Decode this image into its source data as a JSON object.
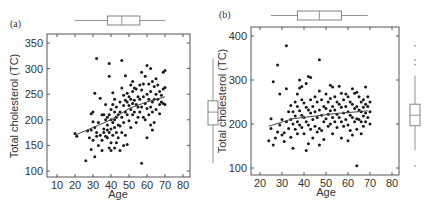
{
  "chart_data": [
    {
      "panel": "(a)",
      "type": "scatter",
      "title": "",
      "xlabel": "Age",
      "ylabel": "Total cholesterol (TC)",
      "xlim": [
        5,
        85
      ],
      "ylim": [
        90,
        360
      ],
      "xticks": [
        10,
        20,
        30,
        40,
        50,
        60,
        70,
        80
      ],
      "yticks": [
        100,
        150,
        200,
        250,
        300,
        350
      ],
      "grid": false,
      "trend_line": {
        "type": "lowess",
        "points": [
          [
            20,
            170
          ],
          [
            30,
            185
          ],
          [
            40,
            200
          ],
          [
            50,
            222
          ],
          [
            60,
            235
          ],
          [
            70,
            245
          ]
        ]
      },
      "marginal_boxplot_x": {
        "min": 20,
        "q1": 38,
        "median": 46,
        "q3": 56,
        "max": 70
      },
      "marginal_boxplot_y": {
        "min": 115,
        "q1": 190,
        "median": 215,
        "q3": 237,
        "max": 320
      },
      "points": [
        [
          20,
          173
        ],
        [
          21,
          168
        ],
        [
          26,
          120
        ],
        [
          27,
          178
        ],
        [
          28,
          165
        ],
        [
          29,
          142
        ],
        [
          29,
          180
        ],
        [
          29,
          212
        ],
        [
          30,
          215
        ],
        [
          30,
          196
        ],
        [
          30,
          160
        ],
        [
          31,
          128
        ],
        [
          31,
          252
        ],
        [
          31,
          185
        ],
        [
          32,
          320
        ],
        [
          32,
          175
        ],
        [
          32,
          168
        ],
        [
          33,
          150
        ],
        [
          33,
          195
        ],
        [
          34,
          242
        ],
        [
          34,
          170
        ],
        [
          35,
          210
        ],
        [
          35,
          160
        ],
        [
          35,
          140
        ],
        [
          36,
          182
        ],
        [
          36,
          175
        ],
        [
          36,
          210
        ],
        [
          37,
          168
        ],
        [
          37,
          200
        ],
        [
          37,
          230
        ],
        [
          38,
          180
        ],
        [
          38,
          205
        ],
        [
          38,
          190
        ],
        [
          38,
          165
        ],
        [
          39,
          285
        ],
        [
          39,
          310
        ],
        [
          39,
          210
        ],
        [
          39,
          175
        ],
        [
          39,
          145
        ],
        [
          40,
          220
        ],
        [
          40,
          200
        ],
        [
          40,
          182
        ],
        [
          40,
          155
        ],
        [
          40,
          140
        ],
        [
          41,
          253
        ],
        [
          41,
          230
        ],
        [
          41,
          195
        ],
        [
          41,
          170
        ],
        [
          42,
          240
        ],
        [
          42,
          215
        ],
        [
          42,
          200
        ],
        [
          42,
          185
        ],
        [
          42,
          145
        ],
        [
          43,
          225
        ],
        [
          43,
          205
        ],
        [
          43,
          175
        ],
        [
          43,
          155
        ],
        [
          44,
          210
        ],
        [
          44,
          190
        ],
        [
          44,
          165
        ],
        [
          45,
          235
        ],
        [
          45,
          215
        ],
        [
          45,
          188
        ],
        [
          45,
          140
        ],
        [
          46,
          316
        ],
        [
          46,
          262
        ],
        [
          46,
          205
        ],
        [
          46,
          175
        ],
        [
          47,
          248
        ],
        [
          47,
          228
        ],
        [
          47,
          195
        ],
        [
          47,
          150
        ],
        [
          48,
          286
        ],
        [
          48,
          238
        ],
        [
          48,
          215
        ],
        [
          48,
          170
        ],
        [
          49,
          252
        ],
        [
          49,
          235
        ],
        [
          49,
          210
        ],
        [
          49,
          152
        ],
        [
          50,
          245
        ],
        [
          50,
          228
        ],
        [
          50,
          198
        ],
        [
          51,
          268
        ],
        [
          51,
          240
        ],
        [
          51,
          220
        ],
        [
          51,
          185
        ],
        [
          52,
          275
        ],
        [
          52,
          255
        ],
        [
          52,
          232
        ],
        [
          52,
          210
        ],
        [
          53,
          262
        ],
        [
          53,
          238
        ],
        [
          53,
          215
        ],
        [
          54,
          260
        ],
        [
          54,
          230
        ],
        [
          54,
          195
        ],
        [
          55,
          245
        ],
        [
          55,
          225
        ],
        [
          55,
          205
        ],
        [
          56,
          268
        ],
        [
          56,
          240
        ],
        [
          56,
          215
        ],
        [
          57,
          293
        ],
        [
          57,
          258
        ],
        [
          57,
          225
        ],
        [
          57,
          115
        ],
        [
          58,
          270
        ],
        [
          58,
          245
        ],
        [
          58,
          205
        ],
        [
          59,
          285
        ],
        [
          59,
          232
        ],
        [
          59,
          200
        ],
        [
          60,
          306
        ],
        [
          60,
          250
        ],
        [
          60,
          222
        ],
        [
          60,
          165
        ],
        [
          61,
          270
        ],
        [
          61,
          240
        ],
        [
          61,
          210
        ],
        [
          62,
          300
        ],
        [
          62,
          255
        ],
        [
          62,
          225
        ],
        [
          62,
          190
        ],
        [
          63,
          275
        ],
        [
          63,
          235
        ],
        [
          63,
          215
        ],
        [
          63,
          180
        ],
        [
          64,
          265
        ],
        [
          64,
          240
        ],
        [
          64,
          195
        ],
        [
          65,
          280
        ],
        [
          65,
          250
        ],
        [
          65,
          220
        ],
        [
          66,
          268
        ],
        [
          66,
          240
        ],
        [
          67,
          255
        ],
        [
          67,
          230
        ],
        [
          67,
          212
        ],
        [
          68,
          248
        ],
        [
          68,
          235
        ],
        [
          69,
          293
        ],
        [
          69,
          260
        ],
        [
          69,
          232
        ],
        [
          70,
          296
        ],
        [
          70,
          263
        ],
        [
          70,
          230
        ]
      ]
    },
    {
      "panel": "(b)",
      "type": "scatter",
      "title": "",
      "xlabel": "Age",
      "ylabel": "Total cholesterol (TC)",
      "xlim": [
        17,
        84
      ],
      "ylim": [
        85,
        420
      ],
      "xticks": [
        20,
        30,
        40,
        50,
        60,
        70,
        80
      ],
      "yticks": [
        100,
        200,
        300,
        400
      ],
      "grid": false,
      "trend_line": {
        "type": "lowess",
        "points": [
          [
            24,
            195
          ],
          [
            35,
            212
          ],
          [
            45,
            218
          ],
          [
            55,
            224
          ],
          [
            65,
            228
          ],
          [
            69,
            230
          ]
        ]
      },
      "marginal_boxplot_x": {
        "min": 25,
        "q1": 37,
        "median": 47,
        "q3": 57,
        "max": 69
      },
      "marginal_boxplot_y": {
        "min": 140,
        "q1": 196,
        "median": 220,
        "q3": 245,
        "max": 310,
        "outliers": [
          105,
          335,
          345,
          378
        ]
      },
      "points": [
        [
          24,
          162
        ],
        [
          25,
          190
        ],
        [
          25,
          212
        ],
        [
          26,
          152
        ],
        [
          26,
          296
        ],
        [
          27,
          168
        ],
        [
          28,
          334
        ],
        [
          28,
          182
        ],
        [
          29,
          268
        ],
        [
          29,
          198
        ],
        [
          30,
          175
        ],
        [
          30,
          210
        ],
        [
          31,
          160
        ],
        [
          31,
          180
        ],
        [
          32,
          378
        ],
        [
          32,
          280
        ],
        [
          32,
          205
        ],
        [
          33,
          228
        ],
        [
          33,
          190
        ],
        [
          34,
          242
        ],
        [
          34,
          210
        ],
        [
          34,
          170
        ],
        [
          35,
          145
        ],
        [
          35,
          228
        ],
        [
          35,
          200
        ],
        [
          36,
          250
        ],
        [
          36,
          218
        ],
        [
          36,
          188
        ],
        [
          37,
          268
        ],
        [
          37,
          240
        ],
        [
          37,
          205
        ],
        [
          37,
          178
        ],
        [
          38,
          300
        ],
        [
          38,
          282
        ],
        [
          38,
          230
        ],
        [
          38,
          198
        ],
        [
          39,
          285
        ],
        [
          39,
          255
        ],
        [
          39,
          220
        ],
        [
          39,
          192
        ],
        [
          40,
          248
        ],
        [
          40,
          215
        ],
        [
          40,
          178
        ],
        [
          41,
          140
        ],
        [
          41,
          292
        ],
        [
          41,
          238
        ],
        [
          41,
          205
        ],
        [
          42,
          308
        ],
        [
          42,
          232
        ],
        [
          42,
          198
        ],
        [
          42,
          155
        ],
        [
          43,
          306
        ],
        [
          43,
          255
        ],
        [
          43,
          225
        ],
        [
          43,
          188
        ],
        [
          44,
          240
        ],
        [
          44,
          210
        ],
        [
          44,
          168
        ],
        [
          45,
          262
        ],
        [
          45,
          228
        ],
        [
          45,
          195
        ],
        [
          46,
          250
        ],
        [
          46,
          215
        ],
        [
          46,
          182
        ],
        [
          47,
          346
        ],
        [
          47,
          275
        ],
        [
          47,
          232
        ],
        [
          47,
          190
        ],
        [
          47,
          152
        ],
        [
          48,
          255
        ],
        [
          48,
          220
        ],
        [
          48,
          185
        ],
        [
          49,
          240
        ],
        [
          49,
          205
        ],
        [
          49,
          165
        ],
        [
          50,
          268
        ],
        [
          50,
          235
        ],
        [
          50,
          212
        ],
        [
          51,
          250
        ],
        [
          51,
          222
        ],
        [
          51,
          195
        ],
        [
          52,
          288
        ],
        [
          52,
          258
        ],
        [
          52,
          230
        ],
        [
          52,
          200
        ],
        [
          53,
          284
        ],
        [
          53,
          240
        ],
        [
          53,
          215
        ],
        [
          53,
          178
        ],
        [
          54,
          262
        ],
        [
          54,
          232
        ],
        [
          54,
          205
        ],
        [
          55,
          250
        ],
        [
          55,
          222
        ],
        [
          55,
          192
        ],
        [
          56,
          286
        ],
        [
          56,
          245
        ],
        [
          56,
          215
        ],
        [
          57,
          270
        ],
        [
          57,
          238
        ],
        [
          57,
          205
        ],
        [
          57,
          168
        ],
        [
          58,
          255
        ],
        [
          58,
          225
        ],
        [
          58,
          195
        ],
        [
          59,
          268
        ],
        [
          59,
          240
        ],
        [
          59,
          210
        ],
        [
          60,
          162
        ],
        [
          60,
          262
        ],
        [
          60,
          228
        ],
        [
          60,
          198
        ],
        [
          61,
          250
        ],
        [
          61,
          220
        ],
        [
          61,
          185
        ],
        [
          62,
          280
        ],
        [
          62,
          245
        ],
        [
          62,
          215
        ],
        [
          62,
          175
        ],
        [
          63,
          270
        ],
        [
          63,
          235
        ],
        [
          63,
          205
        ],
        [
          64,
          105
        ],
        [
          64,
          272
        ],
        [
          64,
          240
        ],
        [
          64,
          212
        ],
        [
          64,
          188
        ],
        [
          65,
          262
        ],
        [
          65,
          232
        ],
        [
          65,
          210
        ],
        [
          66,
          250
        ],
        [
          66,
          228
        ],
        [
          66,
          205
        ],
        [
          66,
          178
        ],
        [
          67,
          255
        ],
        [
          67,
          238
        ],
        [
          67,
          218
        ],
        [
          67,
          195
        ],
        [
          68,
          284
        ],
        [
          68,
          245
        ],
        [
          68,
          225
        ],
        [
          68,
          205
        ],
        [
          69,
          262
        ],
        [
          69,
          240
        ],
        [
          69,
          215
        ],
        [
          70,
          250
        ],
        [
          70,
          228
        ],
        [
          70,
          200
        ]
      ]
    }
  ],
  "panels": [
    {
      "label": "(a)",
      "xlabel": "Age",
      "ylabel": "Total cholesterol (TC)",
      "xtick_labels": [
        "10",
        "20",
        "30",
        "40",
        "50",
        "60",
        "70",
        "80"
      ],
      "ytick_labels": [
        "100",
        "150",
        "200",
        "250",
        "300",
        "350"
      ]
    },
    {
      "label": "(b)",
      "xlabel": "Age",
      "ylabel": "Total cholesterol (TC)",
      "xtick_labels": [
        "20",
        "30",
        "40",
        "50",
        "60",
        "70",
        "80"
      ],
      "ytick_labels": [
        "100",
        "200",
        "300",
        "400"
      ]
    }
  ]
}
